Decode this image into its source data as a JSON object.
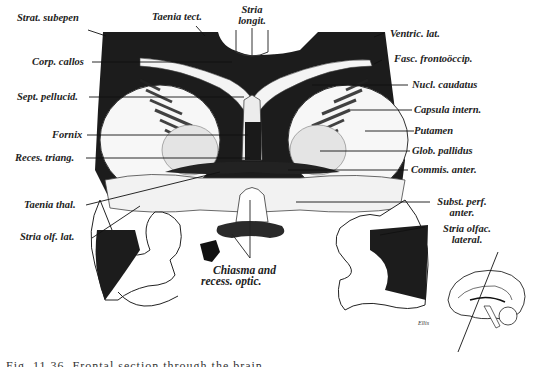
{
  "figure": {
    "labels_left": [
      {
        "id": "strat-subepen",
        "text": "Strat. subepen"
      },
      {
        "id": "corp-callos",
        "text": "Corp. callos"
      },
      {
        "id": "sept-pellucid",
        "text": "Sept. pellucid."
      },
      {
        "id": "fornix",
        "text": "Fornix"
      },
      {
        "id": "reces-triang",
        "text": "Reces. triang."
      },
      {
        "id": "taenia-thal",
        "text": "Taenia thal."
      },
      {
        "id": "stria-olf-lat",
        "text": "Stria olf. lat."
      }
    ],
    "labels_top": [
      {
        "id": "taenia-tect",
        "text": "Taenia tect."
      },
      {
        "id": "stria-longit",
        "line1": "Stria",
        "line2": "longit."
      }
    ],
    "labels_right": [
      {
        "id": "ventric-lat",
        "text": "Ventric. lat."
      },
      {
        "id": "fasc-frontooccip",
        "text": "Fasc. frontoöccip."
      },
      {
        "id": "nucl-caudatus",
        "text": "Nucl. caudatus"
      },
      {
        "id": "capsula-intern",
        "text": "Capsula intern."
      },
      {
        "id": "putamen",
        "text": "Putamen"
      },
      {
        "id": "glob-pallidus",
        "text": "Glob. pallidus"
      },
      {
        "id": "commis-anter",
        "text": "Commis. anter."
      },
      {
        "id": "subst-perf-anter",
        "line1": "Subst. perf.",
        "line2": "anter."
      },
      {
        "id": "stria-olfac-lateral",
        "line1": "Stria olfac.",
        "line2": "lateral."
      }
    ],
    "labels_bottom": [
      {
        "id": "chiasma",
        "line1": "Chiasma and",
        "line2": "recess. optic."
      }
    ],
    "signature": "Ellis",
    "inset": "sagittal brain outline with section plane",
    "caption": "Fig. 11.36. Frontal section through the brain"
  }
}
